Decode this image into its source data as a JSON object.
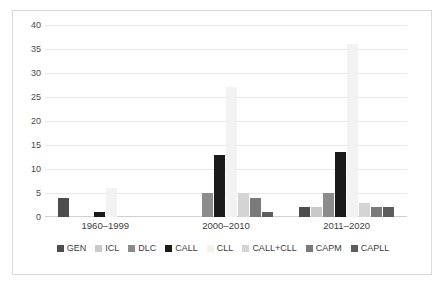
{
  "chart_data": {
    "type": "bar",
    "title": "",
    "subtitle": "",
    "xlabel": "",
    "ylabel": "",
    "ylim": [
      0,
      40
    ],
    "ytick_step": 5,
    "yticks": [
      "0",
      "5",
      "10",
      "15",
      "20",
      "25",
      "30",
      "35",
      "40"
    ],
    "grid": true,
    "legend_position": "bottom",
    "categories": [
      "1960–1999",
      "2000–2010",
      "2011–2020"
    ],
    "series": [
      {
        "name": "GEN",
        "color": "#4d4d4d",
        "values": [
          4,
          0,
          2
        ]
      },
      {
        "name": "ICL",
        "color": "#c9c9c9",
        "values": [
          0,
          0,
          2
        ]
      },
      {
        "name": "DLC",
        "color": "#8c8c8c",
        "values": [
          0,
          5,
          5
        ]
      },
      {
        "name": "CALL",
        "color": "#1a1a1a",
        "values": [
          1,
          13,
          13.5
        ]
      },
      {
        "name": "CLL",
        "color": "#f2f2f2",
        "values": [
          6,
          27,
          36
        ]
      },
      {
        "name": "CALL+CLL",
        "color": "#d4d4d4",
        "values": [
          0,
          5,
          3
        ]
      },
      {
        "name": "CAPM",
        "color": "#7a7a7a",
        "values": [
          0,
          4,
          2
        ]
      },
      {
        "name": "CAPLL",
        "color": "#5c5c5c",
        "values": [
          0,
          1,
          2
        ]
      }
    ]
  },
  "legend": {
    "items": [
      {
        "label": "GEN"
      },
      {
        "label": "ICL"
      },
      {
        "label": "DLC"
      },
      {
        "label": "CALL"
      },
      {
        "label": "CLL"
      },
      {
        "label": "CALL+CLL"
      },
      {
        "label": "CAPM"
      },
      {
        "label": "CAPLL"
      }
    ]
  },
  "style": {
    "gridline_color": "#e8e8e8",
    "border_color": "#d9d9d9",
    "text_color": "#3d3d3d",
    "background": "#ffffff"
  }
}
